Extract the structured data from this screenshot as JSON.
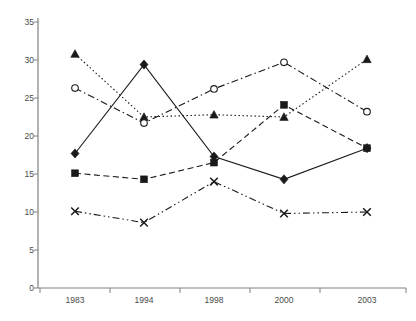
{
  "chart_data": {
    "type": "line",
    "title": "",
    "xlabel": "",
    "ylabel": "",
    "categories": [
      "1983",
      "1994",
      "1998",
      "2000",
      "2003"
    ],
    "ylim": [
      0,
      35
    ],
    "yticks": [
      0,
      5,
      10,
      15,
      20,
      25,
      30,
      35
    ],
    "ytick_labels": [
      "0",
      "5",
      "10",
      "15",
      "20",
      "25",
      "30",
      "35"
    ],
    "grid": false,
    "legend": "none",
    "series": [
      {
        "name": "series-triangle",
        "marker": "triangle",
        "linestyle": "dotted",
        "color": "#1a1a1a",
        "values": [
          30.8,
          22.5,
          22.8,
          22.5,
          30.1
        ]
      },
      {
        "name": "series-open-circle",
        "marker": "open-circle",
        "linestyle": "dash-dot",
        "color": "#1a1a1a",
        "values": [
          26.3,
          21.7,
          26.2,
          29.7,
          23.2
        ]
      },
      {
        "name": "series-diamond",
        "marker": "diamond",
        "linestyle": "solid",
        "color": "#1a1a1a",
        "values": [
          17.7,
          29.4,
          17.3,
          14.3,
          18.4
        ]
      },
      {
        "name": "series-square",
        "marker": "square",
        "linestyle": "dashed",
        "color": "#1a1a1a",
        "values": [
          15.1,
          14.3,
          16.5,
          24.1,
          18.4
        ]
      },
      {
        "name": "series-cross",
        "marker": "x",
        "linestyle": "dash-dot-dot",
        "color": "#1a1a1a",
        "values": [
          10.1,
          8.6,
          14.0,
          9.8,
          10.0
        ]
      }
    ]
  },
  "axes": {
    "y_tick_labels": [
      "35",
      "30",
      "25",
      "20",
      "15",
      "10",
      "5",
      "0"
    ],
    "x_tick_labels": [
      "1983",
      "1994",
      "1998",
      "2000",
      "2003"
    ],
    "axis_color": "#808080"
  }
}
